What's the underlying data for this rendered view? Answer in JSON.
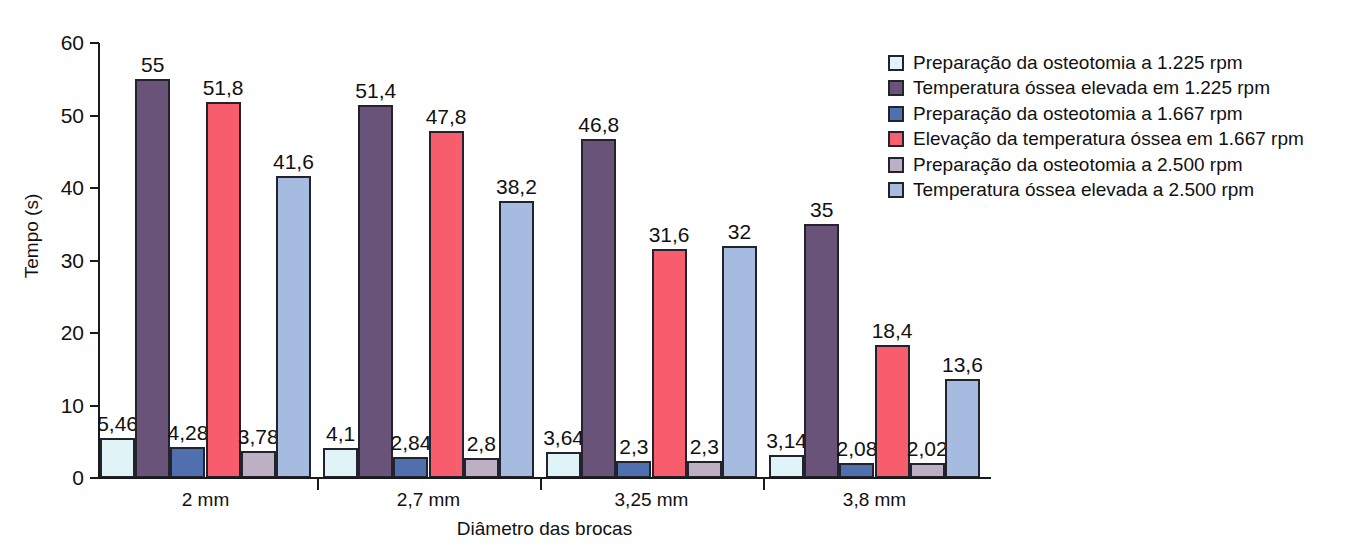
{
  "chart_data": {
    "type": "bar",
    "title": "",
    "xlabel": "Diâmetro das brocas",
    "ylabel": "Tempo (s)",
    "ylim": [
      0,
      60
    ],
    "yticks": [
      0,
      10,
      20,
      30,
      40,
      50,
      60
    ],
    "ytick_labels": [
      "0",
      "10",
      "20",
      "30",
      "40",
      "50",
      "60"
    ],
    "grid": false,
    "legend_position": "right",
    "categories": [
      "2 mm",
      "2,7 mm",
      "3,25 mm",
      "3,8 mm"
    ],
    "series": [
      {
        "name": "Preparação da osteotomia a 1.225 rpm",
        "color": "#e0f3f7",
        "values": [
          5.46,
          4.1,
          3.64,
          3.14
        ],
        "labels": [
          "5,46",
          "4,1",
          "3,64",
          "3,14"
        ]
      },
      {
        "name": "Temperatura óssea elevada em 1.225 rpm",
        "color": "#6a5378",
        "values": [
          55,
          51.4,
          46.8,
          35
        ],
        "labels": [
          "55",
          "51,4",
          "46,8",
          "35"
        ]
      },
      {
        "name": "Preparação da osteotomia a 1.667 rpm",
        "color": "#4f6fae",
        "values": [
          4.28,
          2.84,
          2.3,
          2.08
        ],
        "labels": [
          "4,28",
          "2,84",
          "2,3",
          "2,08"
        ]
      },
      {
        "name": "Elevação da temperatura óssea em 1.667 rpm",
        "color": "#f85d6e",
        "values": [
          51.8,
          47.8,
          31.6,
          18.4
        ],
        "labels": [
          "51,8",
          "47,8",
          "31,6",
          "18,4"
        ]
      },
      {
        "name": "Preparação da osteotomia a 2.500 rpm",
        "color": "#bdafc4",
        "values": [
          3.78,
          2.8,
          2.3,
          2.02
        ],
        "labels": [
          "3,78",
          "2,8",
          "2,3",
          "2,02"
        ]
      },
      {
        "name": "Temperatura óssea elevada a 2.500 rpm",
        "color": "#a5bbe0",
        "values": [
          41.6,
          38.2,
          32,
          13.6
        ],
        "labels": [
          "41,6",
          "38,2",
          "32",
          "13,6"
        ]
      }
    ]
  },
  "legend": {
    "items": [
      {
        "label": "Preparação da osteotomia a 1.225 rpm",
        "color": "#e0f3f7"
      },
      {
        "label": "Temperatura óssea elevada em 1.225 rpm",
        "color": "#6a5378"
      },
      {
        "label": "Preparação da osteotomia a 1.667 rpm",
        "color": "#4f6fae"
      },
      {
        "label": "Elevação da temperatura óssea em 1.667 rpm",
        "color": "#f85d6e"
      },
      {
        "label": "Preparação da osteotomia a 2.500 rpm",
        "color": "#bdafc4"
      },
      {
        "label": "Temperatura óssea elevada a 2.500 rpm",
        "color": "#a5bbe0"
      }
    ]
  }
}
